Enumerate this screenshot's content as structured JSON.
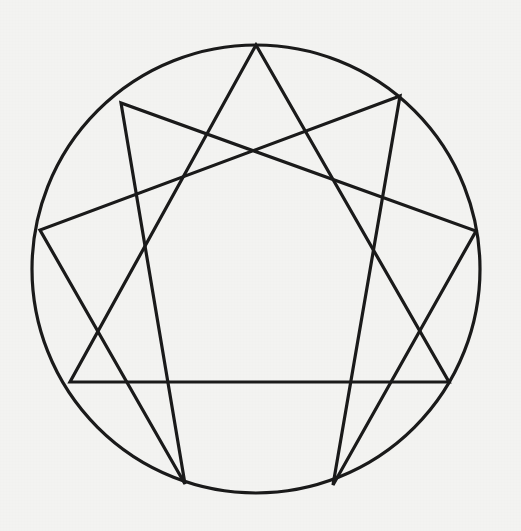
{
  "figure": {
    "name": "Enneagram",
    "type": "geometric-diagram",
    "background_color": "#f3f3f1",
    "stroke_color": "#1a1a1a",
    "circle": {
      "center_x": 256,
      "center_y": 269,
      "radius": 224,
      "stroke_width": 3.2
    },
    "points": [
      {
        "label": "9",
        "x": 256,
        "y": 45
      },
      {
        "label": "1",
        "x": 400,
        "y": 96
      },
      {
        "label": "2",
        "x": 476,
        "y": 231
      },
      {
        "label": "3",
        "x": 449,
        "y": 382
      },
      {
        "label": "4",
        "x": 333,
        "y": 485
      },
      {
        "label": "5",
        "x": 185,
        "y": 484
      },
      {
        "label": "6",
        "x": 70,
        "y": 382
      },
      {
        "label": "7",
        "x": 40,
        "y": 230
      },
      {
        "label": "8",
        "x": 121,
        "y": 103
      }
    ],
    "triangle": {
      "name": "inner-triangle",
      "vertex_labels": [
        "9",
        "3",
        "6"
      ],
      "stroke_width": 3.2,
      "path": "M 256 45 L 449 382 L 70 382 Z"
    },
    "hexad": {
      "name": "hexad-figure",
      "vertex_labels": [
        "1",
        "4",
        "2",
        "8",
        "5",
        "7"
      ],
      "stroke_width": 3.2,
      "path": "M 400 96 L 333 485 L 476 231 L 121 103 L 185 484 L 40 230 Z"
    }
  }
}
